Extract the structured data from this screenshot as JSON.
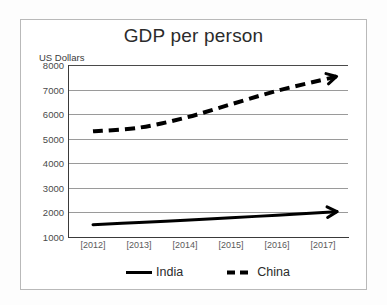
{
  "chart_data": {
    "type": "line",
    "title": "GDP per person",
    "ylabel": "US Dollars",
    "xlabel": "",
    "categories": [
      "[2012]",
      "[2013]",
      "[2014]",
      "[2015]",
      "[2016]",
      "[2017]"
    ],
    "ylim": [
      1000,
      8000
    ],
    "ytick_labels": [
      "8000",
      "7000",
      "6000",
      "5000",
      "4000",
      "3000",
      "2000",
      "1000"
    ],
    "ytick_values": [
      8000,
      7000,
      6000,
      5000,
      4000,
      3000,
      2000,
      1000
    ],
    "grid": true,
    "legend_position": "bottom",
    "series": [
      {
        "name": "India",
        "style": "solid",
        "color": "#000000",
        "arrow_end": true,
        "values": [
          1500,
          1590,
          1680,
          1780,
          1890,
          2000
        ]
      },
      {
        "name": "China",
        "style": "dashed",
        "color": "#000000",
        "arrow_end": true,
        "values": [
          5300,
          5450,
          5850,
          6400,
          6950,
          7400
        ]
      }
    ]
  },
  "chart": {
    "title": "GDP per person",
    "unit_label": "US Dollars"
  },
  "legend": {
    "items": [
      {
        "label": "India",
        "style": "solid"
      },
      {
        "label": "China",
        "style": "dashed"
      }
    ]
  }
}
